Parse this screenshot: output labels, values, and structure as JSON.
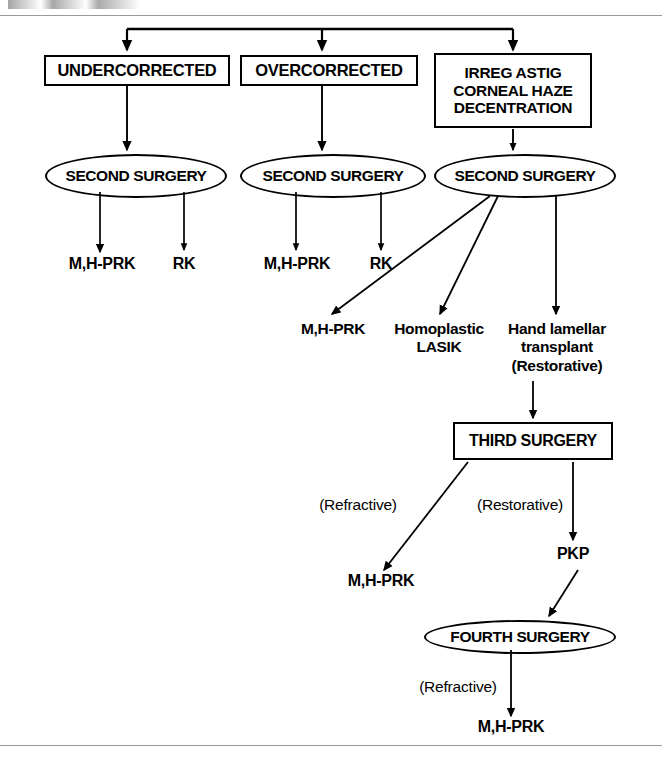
{
  "page": {
    "width": 662,
    "height": 764,
    "background": "#ffffff",
    "line_color": "#000000",
    "rule_color": "#9a9a9a"
  },
  "diagram": {
    "type": "flowchart",
    "top_boxes": [
      {
        "id": "undercorrected",
        "label": "UNDERCORRECTED"
      },
      {
        "id": "overcorrected",
        "label": "OVERCORRECTED"
      },
      {
        "id": "irreg",
        "line1": "IRREG ASTIG",
        "line2": "CORNEAL HAZE",
        "line3": "DECENTRATION"
      }
    ],
    "second_surgery_nodes": [
      {
        "id": "second-surgery-1",
        "label": "SECOND SURGERY"
      },
      {
        "id": "second-surgery-2",
        "label": "SECOND SURGERY"
      },
      {
        "id": "second-surgery-3",
        "label": "SECOND SURGERY"
      }
    ],
    "branch1_leaves": [
      {
        "id": "b1-mhprk",
        "label": "M,H-PRK"
      },
      {
        "id": "b1-rk",
        "label": "RK"
      }
    ],
    "branch2_leaves": [
      {
        "id": "b2-mhprk",
        "label": "M,H-PRK"
      },
      {
        "id": "b2-rk",
        "label": "RK"
      }
    ],
    "branch3_leaves": [
      {
        "id": "b3-mhprk",
        "label": "M,H-PRK"
      },
      {
        "id": "b3-homoplastic",
        "line1": "Homoplastic",
        "line2": "LASIK"
      },
      {
        "id": "b3-hand-lamellar",
        "line1": "Hand lamellar",
        "line2": "transplant",
        "line3": "(Restorative)"
      }
    ],
    "third_surgery": {
      "id": "third-surgery",
      "label": "THIRD SURGERY"
    },
    "third_edge_labels": [
      {
        "id": "third-refractive",
        "label": "(Refractive)"
      },
      {
        "id": "third-restorative",
        "label": "(Restorative)"
      }
    ],
    "third_leaves": [
      {
        "id": "third-mhprk",
        "label": "M,H-PRK"
      },
      {
        "id": "third-pkp",
        "label": "PKP"
      }
    ],
    "fourth_surgery": {
      "id": "fourth-surgery",
      "label": "FOURTH SURGERY"
    },
    "fourth_edge_label": {
      "id": "fourth-refractive",
      "label": "(Refractive)"
    },
    "fourth_leaf": {
      "id": "fourth-mhprk",
      "label": "M,H-PRK"
    }
  }
}
